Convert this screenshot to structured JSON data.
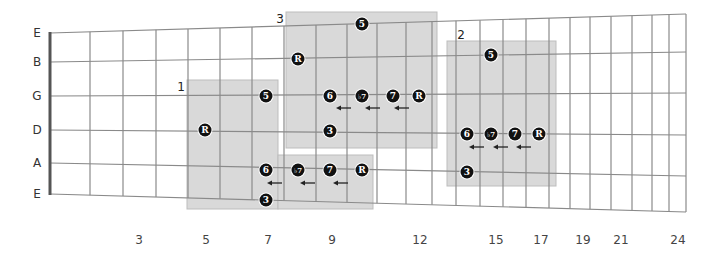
{
  "diagram": {
    "title": "",
    "colors": {
      "box_fill": "#d9d9d9",
      "box_stroke": "#bdbdbd",
      "grid": "#8a8a8a",
      "nut": "#555555",
      "dot": "#111111",
      "dot_text": "#ffffff"
    },
    "strings": [
      {
        "label": "E",
        "y_left": 33,
        "y_right": 14
      },
      {
        "label": "B",
        "y_left": 62,
        "y_right": 52
      },
      {
        "label": "G",
        "y_left": 96,
        "y_right": 93
      },
      {
        "label": "D",
        "y_left": 130,
        "y_right": 135
      },
      {
        "label": "A",
        "y_left": 163,
        "y_right": 176
      },
      {
        "label": "E",
        "y_left": 194,
        "y_right": 212
      }
    ],
    "frets_x": [
      50,
      90,
      123,
      156,
      188,
      220,
      252,
      284,
      316,
      347,
      377,
      406,
      432,
      456,
      480,
      503,
      526,
      549,
      570,
      590,
      611,
      632,
      652,
      669,
      686
    ],
    "fret_labels": [
      {
        "text": "3",
        "x": 139
      },
      {
        "text": "5",
        "x": 206
      },
      {
        "text": "7",
        "x": 268
      },
      {
        "text": "9",
        "x": 332
      },
      {
        "text": "12",
        "x": 420
      },
      {
        "text": "15",
        "x": 496
      },
      {
        "text": "17",
        "x": 541
      },
      {
        "text": "19",
        "x": 583
      },
      {
        "text": "21",
        "x": 621
      },
      {
        "text": "24",
        "x": 678
      }
    ],
    "boxes": [
      {
        "number": "1",
        "label_x": 181,
        "label_y": 87,
        "rects": [
          [
            187,
            80,
            91,
            129
          ],
          [
            278,
            155,
            95,
            54
          ]
        ]
      },
      {
        "number": "3",
        "label_x": 280,
        "label_y": 19,
        "rects": [
          [
            286,
            12,
            151,
            136
          ]
        ]
      },
      {
        "number": "2",
        "label_x": 461,
        "label_y": 35,
        "rects": [
          [
            447,
            41,
            109,
            145
          ]
        ]
      }
    ],
    "notes": [
      {
        "box": "1",
        "label": "5",
        "x": 266,
        "y": 96
      },
      {
        "box": "1",
        "label": "R",
        "x": 205,
        "y": 130
      },
      {
        "box": "1",
        "label": "6",
        "x": 266,
        "y": 170
      },
      {
        "box": "1",
        "label": "♭7",
        "x": 298,
        "y": 170
      },
      {
        "box": "1",
        "label": "7",
        "x": 330,
        "y": 170
      },
      {
        "box": "1",
        "label": "R",
        "x": 362,
        "y": 170
      },
      {
        "box": "1",
        "label": "3",
        "x": 266,
        "y": 200
      },
      {
        "box": "3",
        "label": "5",
        "x": 362,
        "y": 24
      },
      {
        "box": "3",
        "label": "R",
        "x": 298,
        "y": 59
      },
      {
        "box": "3",
        "label": "6",
        "x": 330,
        "y": 96
      },
      {
        "box": "3",
        "label": "♭7",
        "x": 362,
        "y": 96
      },
      {
        "box": "3",
        "label": "7",
        "x": 393,
        "y": 96
      },
      {
        "box": "3",
        "label": "R",
        "x": 419,
        "y": 96
      },
      {
        "box": "3",
        "label": "3",
        "x": 330,
        "y": 131
      },
      {
        "box": "2",
        "label": "5",
        "x": 491,
        "y": 55
      },
      {
        "box": "2",
        "label": "6",
        "x": 467,
        "y": 134
      },
      {
        "box": "2",
        "label": "♭7",
        "x": 491,
        "y": 134
      },
      {
        "box": "2",
        "label": "7",
        "x": 515,
        "y": 134
      },
      {
        "box": "2",
        "label": "R",
        "x": 539,
        "y": 134
      },
      {
        "box": "2",
        "label": "3",
        "x": 467,
        "y": 172
      }
    ],
    "arrows": [
      {
        "x1": 282,
        "x2": 267,
        "y": 183
      },
      {
        "x1": 315,
        "x2": 300,
        "y": 183
      },
      {
        "x1": 348,
        "x2": 333,
        "y": 183
      },
      {
        "x1": 351,
        "x2": 336,
        "y": 108
      },
      {
        "x1": 380,
        "x2": 365,
        "y": 108
      },
      {
        "x1": 409,
        "x2": 394,
        "y": 108
      },
      {
        "x1": 484,
        "x2": 469,
        "y": 147
      },
      {
        "x1": 508,
        "x2": 493,
        "y": 147
      },
      {
        "x1": 531,
        "x2": 516,
        "y": 147
      }
    ]
  }
}
